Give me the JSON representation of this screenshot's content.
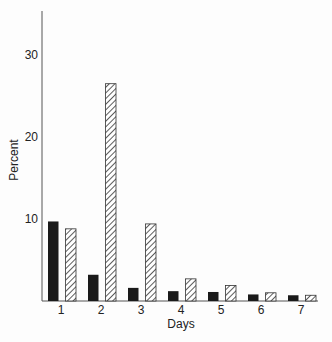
{
  "chart_data": {
    "type": "bar",
    "title": "",
    "xlabel": "Days",
    "ylabel": "Percent",
    "categories": [
      "1",
      "2",
      "3",
      "4",
      "5",
      "6",
      "7"
    ],
    "series": [
      {
        "name": "solid",
        "pattern": "solid-black",
        "values": [
          9.7,
          3.2,
          1.6,
          1.2,
          1.1,
          0.8,
          0.7
        ]
      },
      {
        "name": "hatched",
        "pattern": "diagonal-hatch",
        "values": [
          8.8,
          26.5,
          9.4,
          2.7,
          1.9,
          1.0,
          0.7
        ]
      }
    ],
    "yticks": [
      10,
      20,
      30
    ],
    "ylim": [
      0,
      35
    ],
    "grid": false,
    "legend": null
  },
  "colors": {
    "solid": "#1a1a1a",
    "hatch": "#333333",
    "axis": "#555555"
  }
}
